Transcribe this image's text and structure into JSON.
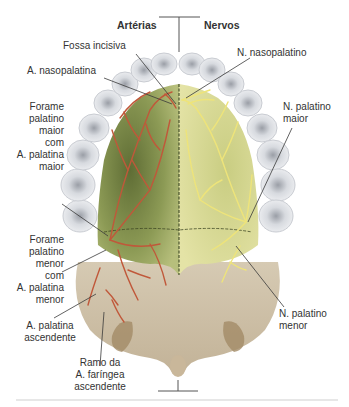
{
  "headers": {
    "left": "Artérias",
    "right": "Nervos"
  },
  "labels": {
    "fossa_incisiva": "Fossa incisiva",
    "a_nasopalatina": "A. nasopalatina",
    "n_nasopalatino": "N. nasopalatino",
    "forame_maior": [
      "Forame",
      "palatino",
      "maior",
      "com",
      "A. palatina",
      "maior"
    ],
    "n_palatino_maior": [
      "N. palatino",
      "maior"
    ],
    "forame_menor": [
      "Forame",
      "palatino",
      "menor",
      "com",
      "A. palatina",
      "menor"
    ],
    "a_palatina_ascendente": [
      "A. palatina",
      "ascendente"
    ],
    "ramo_faringea": [
      "Ramo da",
      "A. faríngea",
      "ascendente"
    ],
    "n_palatino_menor": [
      "N. palatino",
      "menor"
    ]
  },
  "colors": {
    "artery": "#c0583a",
    "nerve": "#e8e27a",
    "bone_left": "#8c9a55",
    "bone_right": "#d9dc96",
    "soft_palate": "#cfc1a8",
    "teeth": "#e4e6ea",
    "leader_line": "#3a3a3a"
  }
}
